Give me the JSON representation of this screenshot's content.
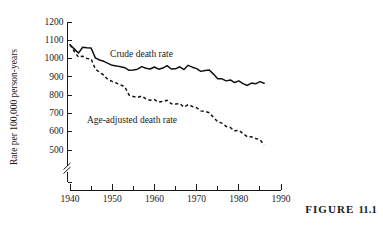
{
  "figure": {
    "caption_label": "FIGURE",
    "caption_number": "11.1"
  },
  "chart_data": {
    "type": "line",
    "title": "",
    "xlabel": "",
    "ylabel": "Rate per 100,000 person-years",
    "xlim": [
      1940,
      1990
    ],
    "ylim": [
      450,
      1200
    ],
    "y_axis_break": true,
    "y_break_below": 500,
    "grid": false,
    "legend": "inline-annotations",
    "xticks": [
      1940,
      1945,
      1950,
      1955,
      1960,
      1965,
      1970,
      1975,
      1980,
      1985,
      1990
    ],
    "xtick_labels": [
      "1940",
      "",
      "1950",
      "",
      "1960",
      "",
      "1970",
      "",
      "1980",
      "",
      "1990"
    ],
    "yticks": [
      500,
      600,
      700,
      800,
      900,
      1000,
      1100,
      1200
    ],
    "ytick_labels": [
      "500",
      "600",
      "700",
      "800",
      "900",
      "1000",
      "1100",
      "1200"
    ],
    "annotations": [
      {
        "text": "Crude death rate",
        "x": 1949.5,
        "y": 1010,
        "name": "crude-death-rate-label"
      },
      {
        "text": "Age-adjusted death rate",
        "x": 1944.0,
        "y": 645,
        "name": "age-adjusted-death-rate-label"
      }
    ],
    "series": [
      {
        "name": "Crude death rate",
        "style": "solid",
        "x": [
          1940,
          1941,
          1942,
          1943,
          1944,
          1945,
          1946,
          1947,
          1948,
          1949,
          1950,
          1951,
          1952,
          1953,
          1954,
          1955,
          1956,
          1957,
          1958,
          1959,
          1960,
          1961,
          1962,
          1963,
          1964,
          1965,
          1966,
          1967,
          1968,
          1969,
          1970,
          1971,
          1972,
          1973,
          1974,
          1975,
          1976,
          1977,
          1978,
          1979,
          1980,
          1981,
          1982,
          1983,
          1984,
          1985,
          1986
        ],
        "values": [
          1076,
          1053,
          1030,
          1062,
          1059,
          1058,
          1004,
          992,
          985,
          974,
          963,
          960,
          955,
          950,
          936,
          938,
          942,
          956,
          947,
          943,
          954,
          942,
          948,
          961,
          943,
          944,
          955,
          940,
          963,
          953,
          945,
          930,
          935,
          938,
          915,
          889,
          889,
          878,
          883,
          869,
          878,
          863,
          853,
          866,
          862,
          874,
          865
        ]
      },
      {
        "name": "Age-adjusted death rate",
        "style": "dashed",
        "x": [
          1940,
          1941,
          1942,
          1943,
          1944,
          1945,
          1946,
          1947,
          1948,
          1949,
          1950,
          1951,
          1952,
          1953,
          1954,
          1955,
          1956,
          1957,
          1958,
          1959,
          1960,
          1961,
          1962,
          1963,
          1964,
          1965,
          1966,
          1967,
          1968,
          1969,
          1970,
          1971,
          1972,
          1973,
          1974,
          1975,
          1976,
          1977,
          1978,
          1979,
          1980,
          1981,
          1982,
          1983,
          1984,
          1985,
          1986
        ],
        "values": [
          1076,
          1040,
          1008,
          1013,
          1001,
          998,
          943,
          925,
          910,
          885,
          875,
          866,
          856,
          845,
          800,
          792,
          788,
          795,
          779,
          772,
          776,
          762,
          765,
          772,
          753,
          751,
          754,
          735,
          748,
          738,
          731,
          714,
          711,
          704,
          679,
          654,
          647,
          629,
          623,
          605,
          607,
          590,
          572,
          572,
          563,
          557,
          527
        ]
      }
    ]
  },
  "icons": {
    "axis_break_icon": "axis-break-slashes"
  }
}
